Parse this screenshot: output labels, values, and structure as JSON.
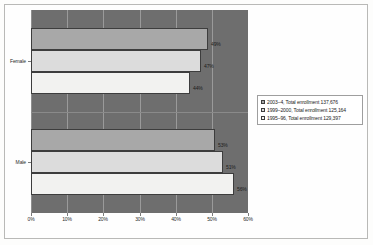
{
  "chart_data": {
    "type": "bar",
    "orientation": "horizontal",
    "title": "",
    "xlabel": "",
    "ylabel": "",
    "categories": [
      "Female",
      "Male"
    ],
    "series": [
      {
        "name": "2003–4, Total enrollment 137,676",
        "swatch": "#a8a8a8",
        "values": [
          49,
          51
        ],
        "labels": [
          "49%",
          "53%"
        ]
      },
      {
        "name": "1999–2000, Total enrollment 125,164",
        "swatch": "#dcdcdc",
        "values": [
          47,
          53
        ],
        "labels": [
          "47%",
          "51%"
        ]
      },
      {
        "name": "1995–96, Total enrollment 129,397",
        "swatch": "#f4f4f2",
        "values": [
          44,
          56
        ],
        "labels": [
          "44%",
          "56%"
        ]
      }
    ],
    "bars": [
      {
        "category": "Female",
        "series": "2003–4, Total enrollment 137,676",
        "value": 49,
        "label": "49%"
      },
      {
        "category": "Female",
        "series": "1999–2000, Total enrollment 125,164",
        "value": 47,
        "label": "47%"
      },
      {
        "category": "Female",
        "series": "1995–96, Total enrollment 129,397",
        "value": 44,
        "label": "44%"
      },
      {
        "category": "Male",
        "series": "2003–4, Total enrollment 137,676",
        "value": 51,
        "label": "51%"
      },
      {
        "category": "Male",
        "series": "1999–2000, Total enrollment 125,164",
        "value": 53,
        "label": "53%"
      },
      {
        "category": "Male",
        "series": "1995–96, Total enrollment 129,397",
        "value": 56,
        "label": "56%"
      }
    ],
    "xlim": [
      0,
      60
    ],
    "xticks": [
      "0%",
      "10%",
      "20%",
      "30%",
      "40%",
      "50%",
      "60%"
    ],
    "xtick_values": [
      0,
      10,
      20,
      30,
      40,
      50,
      60
    ],
    "grid": true,
    "legend_position": "right",
    "plot_background": "#6e6e6e",
    "gridline_color": "#9a9a9a"
  },
  "axis": {
    "y_labels": [
      "Female",
      "Male"
    ]
  },
  "legend": {
    "entries": [
      "2003–4, Total enrollment 137,676",
      "1999–2000, Total enrollment 125,164",
      "1995–96, Total enrollment 129,397"
    ]
  },
  "bar_labels": {
    "female": [
      "49%",
      "47%",
      "44%"
    ],
    "male": [
      "51%",
      "53%",
      "56%"
    ]
  }
}
